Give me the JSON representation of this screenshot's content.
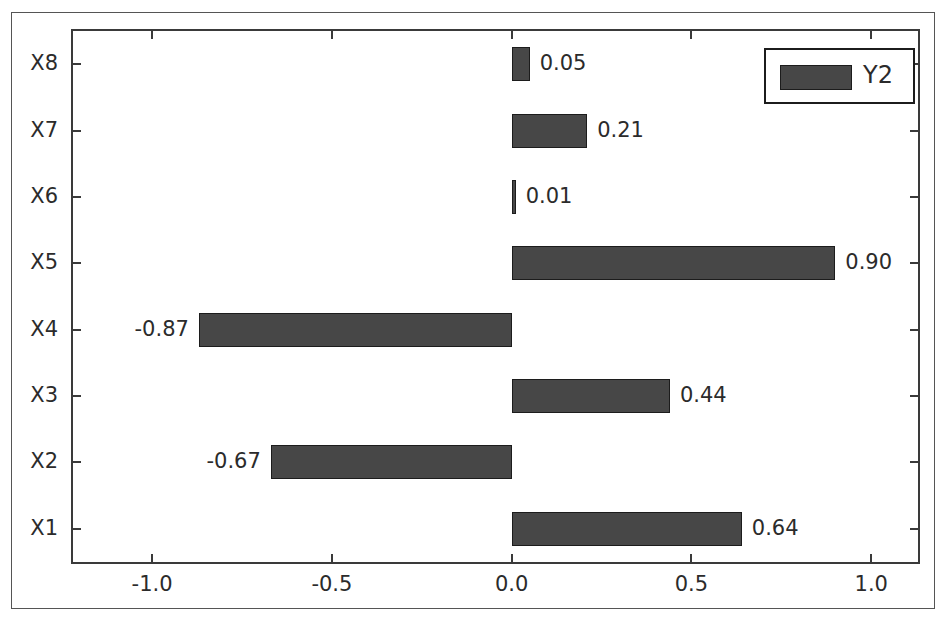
{
  "chart_data": {
    "type": "bar",
    "orientation": "horizontal",
    "title": "",
    "xlabel": "",
    "ylabel": "",
    "categories": [
      "X1",
      "X2",
      "X3",
      "X4",
      "X5",
      "X6",
      "X7",
      "X8"
    ],
    "values": [
      0.64,
      -0.67,
      0.44,
      -0.87,
      0.9,
      0.01,
      0.21,
      0.05
    ],
    "data_labels": [
      "0.64",
      "-0.67",
      "0.44",
      "-0.87",
      "0.90",
      "0.01",
      "0.21",
      "0.05"
    ],
    "series": [
      {
        "name": "Y2",
        "values": [
          0.64,
          -0.67,
          0.44,
          -0.87,
          0.9,
          0.01,
          0.21,
          0.05
        ],
        "color": "#474747"
      }
    ],
    "xlim": [
      -1.22,
      1.13
    ],
    "xticks": [
      -1.0,
      -0.5,
      0.0,
      0.5,
      1.0
    ],
    "xtick_labels": [
      "-1.0",
      "-0.5",
      "0.0",
      "0.5",
      "1.0"
    ],
    "ytick_labels": [
      "X1",
      "X2",
      "X3",
      "X4",
      "X5",
      "X6",
      "X7",
      "X8"
    ],
    "grid": false,
    "legend": {
      "entries": [
        {
          "label": "Y2",
          "color": "#474747"
        }
      ],
      "position": "upper right"
    },
    "bar_color": "#474747",
    "bar_edge_color": "#1c1c1c",
    "axis_color": "#3a3a3a",
    "text_color": "#2b2b2b",
    "background_color": "#ffffff"
  }
}
